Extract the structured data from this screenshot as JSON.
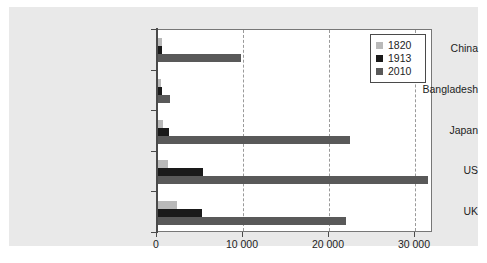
{
  "chart_data": {
    "type": "bar",
    "orientation": "horizontal",
    "title": "",
    "xlabel": "",
    "ylabel": "",
    "categories": [
      "China",
      "Bangladesh",
      "Japan",
      "US",
      "UK"
    ],
    "series": [
      {
        "name": "1820",
        "color": "#b9b9b9",
        "values": [
          600,
          500,
          700,
          1250,
          2300
        ]
      },
      {
        "name": "1913",
        "color": "#1a1a1a",
        "values": [
          550,
          600,
          1400,
          5300,
          5200
        ]
      },
      {
        "name": "2010",
        "color": "#595959",
        "values": [
          9800,
          1500,
          22500,
          31500,
          22000
        ]
      }
    ],
    "xlim": [
      0,
      32100
    ],
    "xticks": [
      0,
      10000,
      20000,
      30000
    ],
    "xtick_labels": [
      "0",
      "10 000",
      "20 000",
      "30 000"
    ],
    "grid": "vertical-dashed",
    "legend_position": "top-right",
    "legend_entries": [
      "1820",
      "1913",
      "2010"
    ]
  },
  "style": {
    "panel_bg": "#e9e9e9",
    "plot_bg": "#ffffff",
    "axis_color": "#4a4a4a",
    "grid_color": "#9a9a9a",
    "text_color": "#1d1d1d"
  }
}
